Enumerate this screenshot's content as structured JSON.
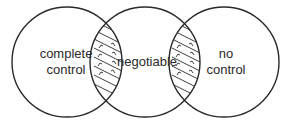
{
  "diagram": {
    "type": "venn-three-circles",
    "circles": [
      {
        "id": "left",
        "label_lines": [
          "complete",
          "control"
        ]
      },
      {
        "id": "middle",
        "label_lines": [
          "negotiable"
        ]
      },
      {
        "id": "right",
        "label_lines": [
          "no",
          "control"
        ]
      }
    ],
    "overlaps": [
      {
        "between": [
          "left",
          "middle"
        ],
        "style": "hatched-with-arrows"
      },
      {
        "between": [
          "middle",
          "right"
        ],
        "style": "hatched-with-arrows"
      }
    ],
    "colors": {
      "stroke": "#2a2a2a",
      "text": "#2a2a2a",
      "background": "#ffffff"
    }
  }
}
